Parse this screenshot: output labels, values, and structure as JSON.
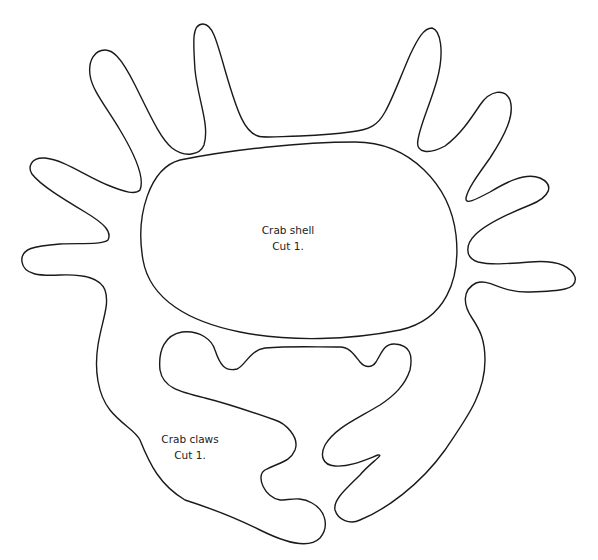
{
  "diagram": {
    "type": "craft-template",
    "background": "#ffffff",
    "stroke_color": "#1a1a1a",
    "pieces": [
      {
        "id": "crab-shell",
        "name": "Crab shell",
        "instruction": "Cut 1.",
        "description": "Rounded oval body shell"
      },
      {
        "id": "crab-legs",
        "name": "Crab legs",
        "description": "Outer outline with 8 finger-like legs (4 each side) surrounding the shell"
      },
      {
        "id": "crab-claws",
        "name": "Crab claws",
        "instruction": "Cut 1.",
        "description": "Lower piece with two pincer claws"
      }
    ]
  },
  "labels": {
    "shell": {
      "line1": "Crab shell",
      "line2": "Cut 1."
    },
    "claws": {
      "line1": "Crab claws",
      "line2": "Cut 1."
    }
  }
}
